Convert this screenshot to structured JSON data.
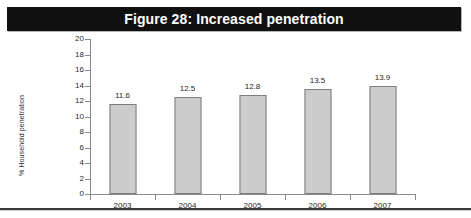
{
  "figure": {
    "title": "Figure 28: Increased penetration",
    "title_bar_color": "#111111",
    "title_text_color": "#ffffff"
  },
  "chart_data": {
    "type": "bar",
    "title": "Figure 28: Increased penetration",
    "categories": [
      "2003",
      "2004",
      "2005",
      "2006",
      "2007"
    ],
    "values": [
      11.6,
      12.5,
      12.8,
      13.5,
      13.9
    ],
    "value_labels": [
      "11.6",
      "12.5",
      "12.8",
      "13.5",
      "13.9"
    ],
    "xlabel": "",
    "ylabel": "% Household penetration",
    "ylim": [
      0,
      20
    ],
    "ytick_step": 2,
    "yticks": [
      0,
      2,
      4,
      6,
      8,
      10,
      12,
      14,
      16,
      18,
      20
    ],
    "ytick_labels": [
      "0",
      "2",
      "4",
      "6",
      "8",
      "10",
      "12",
      "14",
      "16",
      "18",
      "20"
    ],
    "grid": false,
    "legend": false,
    "legend_position": "none",
    "bar_fill_color": "#cccccc",
    "bar_border_color": "#7d7d7d",
    "axis_color": "#8a8a8a",
    "text_color": "#2b2b2b"
  }
}
